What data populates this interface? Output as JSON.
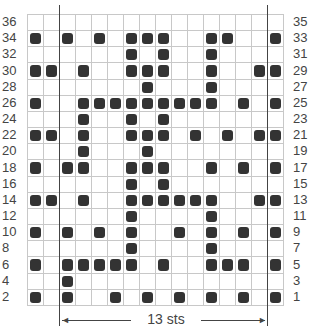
{
  "chart_data": {
    "type": "heatmap",
    "columns": 16,
    "rows": 18,
    "repeat": {
      "label": "13 sts",
      "start_col": 3,
      "end_col": 15
    },
    "left_row_labels": [
      "36",
      "34",
      "32",
      "30",
      "28",
      "26",
      "24",
      "22",
      "20",
      "18",
      "16",
      "14",
      "12",
      "10",
      "8",
      "6",
      "4",
      "2"
    ],
    "right_row_labels": [
      "35",
      "33",
      "31",
      "29",
      "27",
      "25",
      "23",
      "21",
      "19",
      "17",
      "15",
      "13",
      "11",
      "9",
      "7",
      "5",
      "3",
      "1"
    ],
    "filled_cells_by_row": [
      [],
      [
        1,
        3,
        5,
        7,
        8,
        9,
        12,
        13,
        16
      ],
      [
        7,
        9,
        12
      ],
      [
        1,
        2,
        4,
        7,
        8,
        9,
        12,
        15,
        16
      ],
      [
        8,
        12
      ],
      [
        1,
        4,
        5,
        6,
        7,
        8,
        9,
        10,
        11,
        12,
        14,
        16
      ],
      [
        4,
        7,
        9
      ],
      [
        1,
        2,
        4,
        7,
        8,
        9,
        11,
        13,
        15,
        16
      ],
      [
        4,
        8
      ],
      [
        1,
        3,
        4,
        7,
        8,
        9,
        12,
        14,
        16
      ],
      [
        7,
        9
      ],
      [
        1,
        2,
        4,
        7,
        8,
        9,
        10,
        11,
        12,
        15,
        16
      ],
      [
        7,
        12
      ],
      [
        1,
        3,
        5,
        7,
        10,
        12,
        14,
        16
      ],
      [
        7,
        12
      ],
      [
        1,
        3,
        4,
        5,
        6,
        7,
        9,
        12,
        13,
        14,
        16
      ],
      [
        3
      ],
      [
        1,
        3,
        6,
        8,
        10,
        12,
        14,
        16
      ]
    ],
    "colors": {
      "filled": "#333333",
      "grid": "#c8c8c8",
      "background": "#ffffff"
    }
  }
}
